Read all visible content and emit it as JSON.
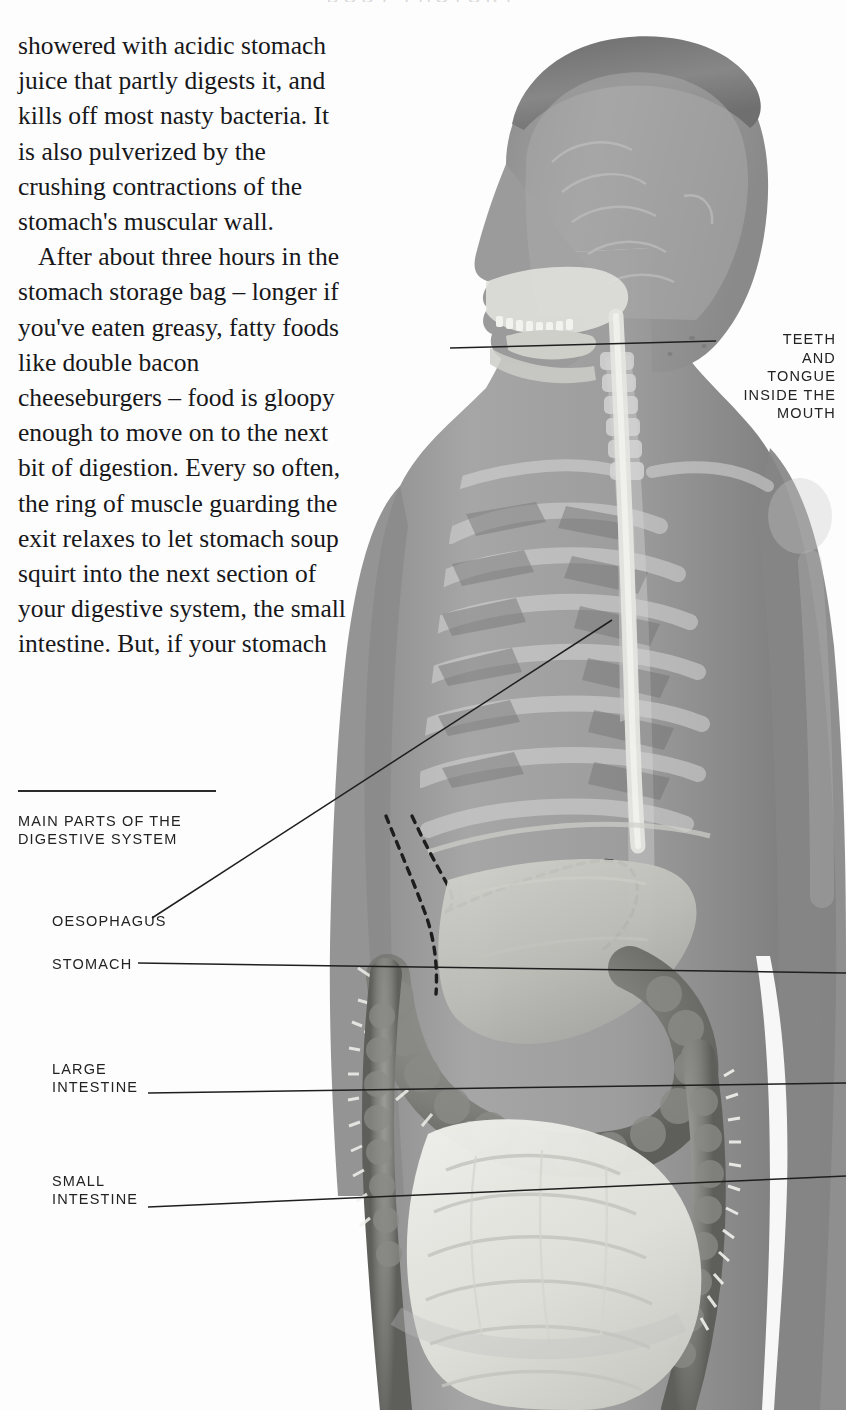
{
  "page": {
    "width": 846,
    "height": 1410,
    "background_color": "#fdfdfd",
    "text_color": "#17171a",
    "running_head": "BODY  FACTORY"
  },
  "body_copy": {
    "paragraphs": [
      "showered with acidic stomach juice that partly digests it, and kills off most nasty bacteria. It is also pulverized by the crushing contractions of the stomach's muscular wall.",
      "After about three hours in the stomach storage bag – longer if you've eaten greasy, fatty foods like double bacon cheeseburgers – food is gloopy enough to move on to the next bit of digestion. Every so often, the ring of muscle guarding the exit relaxes to let stomach soup squirt into the next section of your digestive system, the small intestine. But, if your stomach"
    ]
  },
  "captions": {
    "main": "MAIN PARTS OF THE\nDIGESTIVE SYSTEM",
    "oesophagus": "OESOPHAGUS",
    "stomach": "STOMACH",
    "large_intestine": "LARGE\nINTESTINE",
    "small_intestine": "SMALL\nINTESTINE",
    "teeth_and_tongue": "TEETH\nAND\nTONGUE\nINSIDE THE\nMOUTH"
  },
  "illustration": {
    "name": "human-torso-digestive-system",
    "description": "Grayscale semi-transparent anatomical illustration of a man's head and torso showing the skull, spine, ribcage, oesophagus, liver, stomach outline, large intestine and small intestine",
    "colors": {
      "skin": "#9a9a9a",
      "skin_dark": "#7b7b7b",
      "bone": "#cfcfcf",
      "organ_light": "#e3e3e0",
      "organ_mid": "#b9b9b6",
      "organ_dark": "#6f6f6f",
      "line": "#1c1c1c"
    }
  },
  "leader_lines": [
    {
      "name": "oesophagus-leader",
      "from": [
        152,
        918
      ],
      "to": [
        602,
        620
      ]
    },
    {
      "name": "stomach-leader",
      "from": [
        138,
        962
      ],
      "to": [
        880,
        972
      ]
    },
    {
      "name": "large-intestine-leader",
      "from": [
        148,
        1093
      ],
      "to": [
        880,
        1084
      ]
    },
    {
      "name": "small-intestine-leader",
      "from": [
        148,
        1207
      ],
      "to": [
        880,
        1178
      ]
    },
    {
      "name": "teeth-leader",
      "from": [
        718,
        341
      ],
      "to": [
        455,
        348
      ]
    }
  ]
}
